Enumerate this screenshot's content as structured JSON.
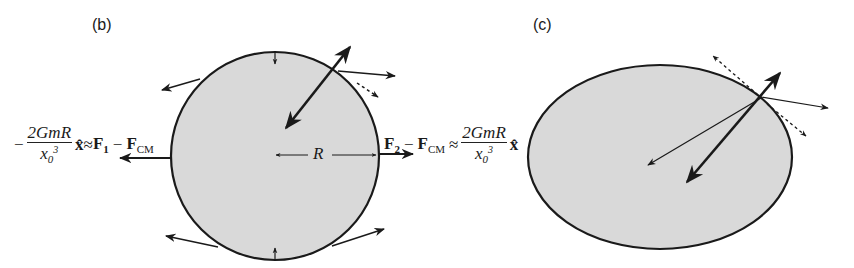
{
  "figure": {
    "panels": [
      {
        "id": "b",
        "label": "(b)",
        "shape": "circle",
        "radius_label": "R",
        "left_expression": {
          "sign": "−",
          "numerator": "2GmR",
          "denominator_base": "x",
          "denominator_sub": "0",
          "denominator_sup": "3",
          "unit_vector": "x̂",
          "approx": "≈",
          "force_a": "F",
          "force_a_sub": "1",
          "minus": "−",
          "force_b": "F",
          "force_b_sub": "CM"
        },
        "right_expression": {
          "force_a": "F",
          "force_a_sub": "2",
          "minus": "−",
          "force_b": "F",
          "force_b_sub": "CM",
          "approx": "≈",
          "numerator": "2GmR",
          "denominator_base": "x",
          "denominator_sub": "0",
          "denominator_sup": "3",
          "unit_vector": "x̂"
        }
      },
      {
        "id": "c",
        "label": "(c)",
        "shape": "ellipse"
      }
    ],
    "colors": {
      "fill": "#d9d9d9",
      "stroke": "#1a1a1a",
      "background": "#ffffff"
    }
  }
}
